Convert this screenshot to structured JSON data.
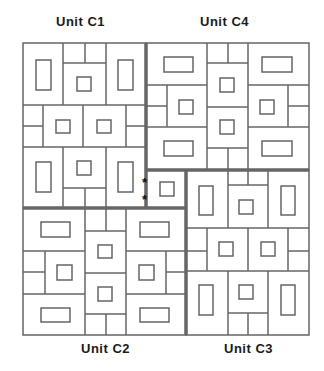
{
  "units": [
    {
      "id": "C1",
      "label": "Unit C1",
      "position": "top-left"
    },
    {
      "id": "C4",
      "label": "Unit C4",
      "position": "top-right"
    },
    {
      "id": "C2",
      "label": "Unit C2",
      "position": "bottom-left"
    },
    {
      "id": "C3",
      "label": "Unit C3",
      "position": "bottom-right"
    }
  ],
  "center": {
    "description": "shared central cell with a small square",
    "markers": [
      "*",
      "*"
    ]
  },
  "colors": {
    "line": "#666666",
    "thick_line": "#666666",
    "text": "#1a1a1a",
    "background": "#ffffff"
  }
}
